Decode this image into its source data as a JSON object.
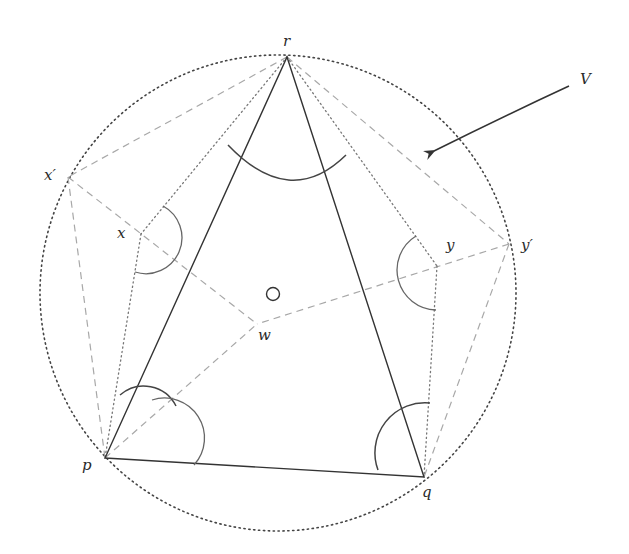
{
  "diagram": {
    "title": "",
    "labels": {
      "r": "r",
      "p": "p",
      "q": "q",
      "x": "x",
      "x_prime": "x′",
      "y": "y",
      "y_prime": "y′",
      "w": "w",
      "V": "V",
      "O": "O"
    },
    "points": {
      "r": [
        287,
        57
      ],
      "p": [
        105,
        458
      ],
      "q": [
        424,
        477
      ],
      "x": [
        141,
        234
      ],
      "x_prime": [
        68,
        177
      ],
      "y": [
        437,
        266
      ],
      "y_prime": [
        509,
        244
      ],
      "w": [
        257,
        324
      ],
      "O": [
        274,
        294
      ]
    },
    "circumcircle": {
      "cx": 278,
      "cy": 293,
      "r": 238,
      "style": "dotted"
    },
    "triangle": [
      "p",
      "q",
      "r"
    ],
    "arrow": {
      "label": "V",
      "from": [
        570,
        85
      ],
      "to": [
        432,
        152
      ]
    },
    "colors": {
      "solid": "#333333",
      "dashed": "#a8a8a8",
      "dotted": "#777777"
    }
  }
}
